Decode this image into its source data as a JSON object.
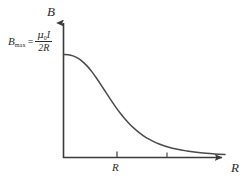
{
  "figure": {
    "background_color": "#ffffff",
    "stroke_color": "#4a4a4a",
    "axis_color": "#3a3a3a",
    "text_color": "#2b2b2b"
  },
  "axes": {
    "y_label": "B",
    "x_label": "R",
    "y_label_name": "magnetic-field",
    "x_label_name": "distance"
  },
  "y_intercept_label": {
    "symbol": "B",
    "subscript": "max",
    "equals": "=",
    "numerator_mu": "μ",
    "numerator_mu_sub": "0",
    "numerator_current": "I",
    "denominator": "2R",
    "plain_text": "B_max = μ₀I / 2R"
  },
  "ticks": {
    "x": [
      {
        "label": "R",
        "x_frac": 0.327,
        "has_label": true
      },
      {
        "label": "",
        "x_frac": 0.63,
        "has_label": false
      }
    ]
  },
  "chart_data": {
    "type": "line",
    "title": "",
    "xlabel": "R",
    "ylabel": "B",
    "grid": false,
    "legend": null,
    "annotations": [
      {
        "text": "B_max = μ₀I/2R",
        "target": "y-intercept",
        "x": 0,
        "y": 1.0
      }
    ],
    "xlim": [
      0,
      3.4
    ],
    "ylim": [
      0,
      1.12
    ],
    "series": [
      {
        "name": "B(R) magnetic field of circular loop on axis",
        "x": [
          0.0,
          0.1,
          0.2,
          0.3,
          0.4,
          0.5,
          0.6,
          0.7,
          0.8,
          0.9,
          1.0,
          1.1,
          1.2,
          1.3,
          1.4,
          1.5,
          1.6,
          1.7,
          1.8,
          1.9,
          2.0,
          2.2,
          2.4,
          2.6,
          2.8,
          3.0,
          3.2,
          3.4
        ],
        "y": [
          1.0,
          0.997,
          0.985,
          0.963,
          0.93,
          0.886,
          0.83,
          0.766,
          0.697,
          0.626,
          0.556,
          0.489,
          0.427,
          0.371,
          0.321,
          0.277,
          0.239,
          0.206,
          0.178,
          0.154,
          0.134,
          0.102,
          0.079,
          0.063,
          0.05,
          0.041,
          0.034,
          0.028
        ]
      }
    ]
  }
}
